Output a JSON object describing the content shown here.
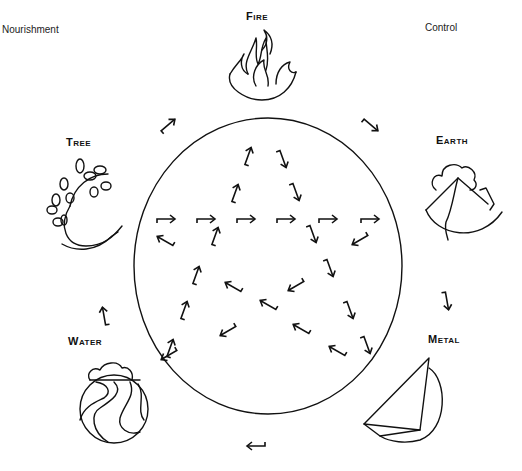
{
  "diagram": {
    "type": "five-elements-cycle",
    "legend": {
      "nourishment_label": "Nourishment",
      "control_label": "Control"
    },
    "elements": [
      {
        "id": "fire",
        "label": "Fire",
        "icon": "flame-icon"
      },
      {
        "id": "earth",
        "label": "Earth",
        "icon": "mountain-icon"
      },
      {
        "id": "metal",
        "label": "Metal",
        "icon": "metal-triangle-icon"
      },
      {
        "id": "water",
        "label": "Water",
        "icon": "waves-icon"
      },
      {
        "id": "tree",
        "label": "Tree",
        "icon": "vine-icon"
      }
    ],
    "nourishment_cycle": [
      "Tree",
      "Fire",
      "Earth",
      "Metal",
      "Water",
      "Tree"
    ],
    "control_cycle": [
      "Fire",
      "Metal",
      "Tree",
      "Earth",
      "Water",
      "Fire"
    ],
    "colors": {
      "line": "#111111",
      "background": "#ffffff"
    }
  }
}
